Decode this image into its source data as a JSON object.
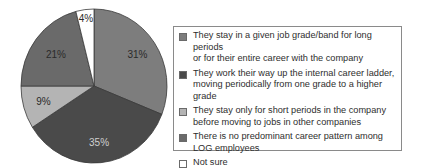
{
  "chart_data": {
    "type": "pie",
    "title": "",
    "start_angle_deg": 0,
    "direction": "clockwise",
    "slices": [
      {
        "label": "They stay in a given job grade/band for long periods or for their entire career with the company",
        "value": 31,
        "display": "31%",
        "color": "#7d7d7d",
        "label_color": "#2a2a2a"
      },
      {
        "label": "They work their way up the internal career ladder, moving periodically from one grade to a higher grade",
        "value": 35,
        "display": "35%",
        "color": "#4a4a4a",
        "label_color": "#d0d0d0"
      },
      {
        "label": "They stay only for short periods in the company before moving to jobs in other companies",
        "value": 9,
        "display": "9%",
        "color": "#b4b4b4",
        "label_color": "#2a2a2a"
      },
      {
        "label": "There is no predominant career pattern among LOG employees",
        "value": 21,
        "display": "21%",
        "color": "#6a6a6a",
        "label_color": "#2a2a2a"
      },
      {
        "label": "Not sure",
        "value": 4,
        "display": "4%",
        "color": "#ffffff",
        "label_color": "#2a2a2a"
      }
    ],
    "legend_position": "right"
  },
  "legend": {
    "items": [
      {
        "line1": "They stay in a given job grade/band for long periods",
        "line2": "or for their entire career with the company"
      },
      {
        "line1": "They work their way up the internal career ladder,",
        "line2": "moving periodically from one grade to a higher grade"
      },
      {
        "line1": "They stay only for short periods in the company",
        "line2": "before moving to jobs in other companies"
      },
      {
        "line1": "There is no predominant career pattern among",
        "line2": "LOG employees"
      },
      {
        "line1": "Not sure",
        "line2": ""
      }
    ]
  }
}
